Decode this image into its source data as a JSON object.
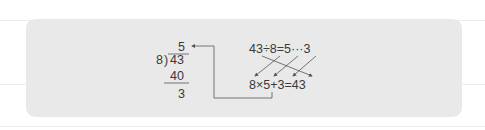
{
  "long_division": {
    "quotient": "5",
    "divisor": "8",
    "bracket": ")",
    "dividend": "43",
    "product": "40",
    "remainder": "3"
  },
  "division_equation": {
    "text": "43÷8=5···3"
  },
  "check_equation": {
    "text": "8×5+3=43"
  },
  "colors": {
    "panel": "#e9e9e9",
    "text": "#3a3a3a",
    "arrow": "#555555"
  }
}
